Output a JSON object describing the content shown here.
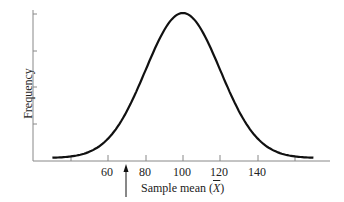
{
  "chart_data": {
    "type": "line",
    "title": "",
    "xlabel": "Sample mean (X̄)",
    "ylabel": "Frequency",
    "x_ticks": [
      40,
      60,
      80,
      100,
      120,
      140,
      160
    ],
    "x_tick_labels": [
      "",
      "60",
      "80",
      "100",
      "120",
      "140",
      ""
    ],
    "y_ticks_count": 4,
    "xlim": [
      30,
      170
    ],
    "grid": false,
    "legend": null,
    "series": [
      {
        "name": "Sampling distribution of the mean",
        "shape": "normal",
        "mean": 100,
        "sd": 20,
        "x": [
          30,
          40,
          50,
          60,
          70,
          80,
          90,
          100,
          110,
          120,
          130,
          140,
          150,
          160,
          170
        ],
        "y": [
          0.04,
          0.09,
          0.18,
          0.32,
          0.51,
          0.7,
          0.88,
          1.0,
          0.88,
          0.7,
          0.51,
          0.32,
          0.18,
          0.09,
          0.04
        ]
      }
    ],
    "annotations": [
      {
        "type": "arrow",
        "x": 70,
        "direction": "up",
        "label": ""
      }
    ]
  },
  "labels": {
    "ylabel": "Frequency",
    "xlabel_prefix": "Sample mean (",
    "xlabel_symbol": "X",
    "xlabel_suffix": ")",
    "ticks": [
      "60",
      "80",
      "100",
      "120",
      "140"
    ]
  }
}
